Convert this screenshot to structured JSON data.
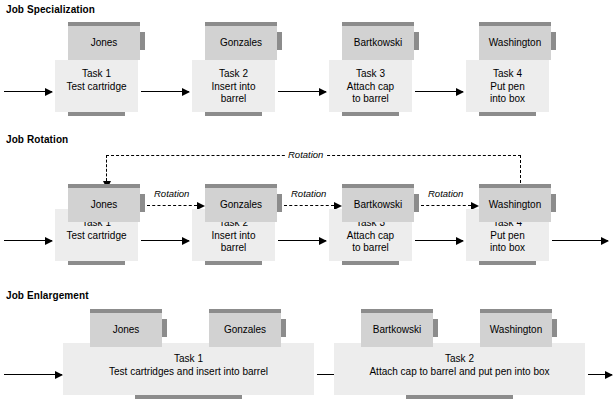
{
  "diagram": {
    "type": "process-flow-diagram",
    "colors": {
      "person_fill": "#d2d2d2",
      "task_fill": "#ededed",
      "bar_gray": "#8c8c8c",
      "line_black": "#000000",
      "background": "#ffffff"
    }
  },
  "sections": [
    {
      "id": "job-specialization",
      "heading": "Job Specialization",
      "stations": [
        {
          "person": "Jones",
          "task_label": "Task 1",
          "task_lines": [
            "Test cartridge"
          ]
        },
        {
          "person": "Gonzales",
          "task_label": "Task 2",
          "task_lines": [
            "Insert into",
            "barrel"
          ]
        },
        {
          "person": "Bartkowski",
          "task_label": "Task 3",
          "task_lines": [
            "Attach cap",
            "to barrel"
          ]
        },
        {
          "person": "Washington",
          "task_label": "Task 4",
          "task_lines": [
            "Put pen",
            "into box"
          ]
        }
      ]
    },
    {
      "id": "job-rotation",
      "heading": "Job Rotation",
      "rotation_label": "Rotation",
      "rotation_labels": [
        "Rotation",
        "Rotation",
        "Rotation",
        "Rotation"
      ],
      "stations": [
        {
          "person": "Jones",
          "task_label": "Task 1",
          "task_lines": [
            "Test cartridge"
          ]
        },
        {
          "person": "Gonzales",
          "task_label": "Task 2",
          "task_lines": [
            "Insert into",
            "barrel"
          ]
        },
        {
          "person": "Bartkowski",
          "task_label": "Task 3",
          "task_lines": [
            "Attach cap",
            "to barrel"
          ]
        },
        {
          "person": "Washington",
          "task_label": "Task 4",
          "task_lines": [
            "Put pen",
            "into box"
          ]
        }
      ]
    },
    {
      "id": "job-enlargement",
      "heading": "Job Enlargement",
      "groups": [
        {
          "persons": [
            "Jones",
            "Gonzales"
          ],
          "task_label": "Task 1",
          "task_lines": [
            "Test cartridges and insert into barrel"
          ]
        },
        {
          "persons": [
            "Bartkowski",
            "Washington"
          ],
          "task_label": "Task 2",
          "task_lines": [
            "Attach cap to barrel and put pen into box"
          ]
        }
      ]
    }
  ]
}
